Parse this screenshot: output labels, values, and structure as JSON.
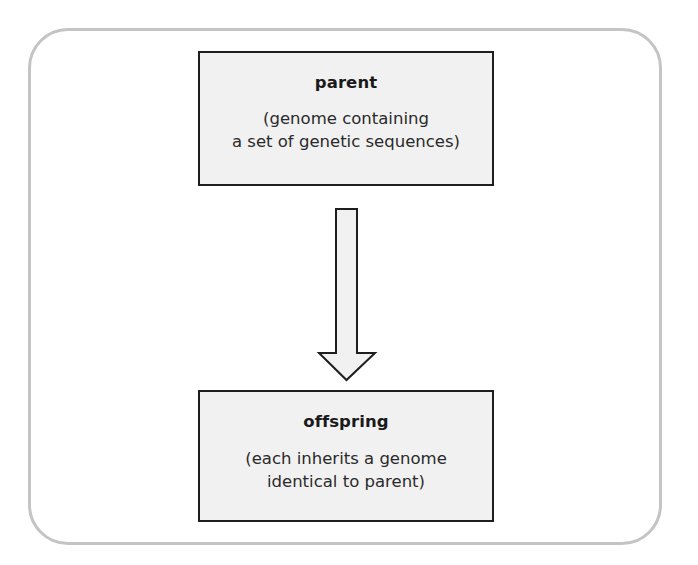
{
  "diagram": {
    "parent": {
      "title": "parent",
      "desc_line1": "(genome containing",
      "desc_line2": "a set of genetic sequences)"
    },
    "arrow": {
      "direction": "down",
      "icon": "down-arrow-icon"
    },
    "offspring": {
      "title": "offspring",
      "desc_line1": "(each inherits a genome",
      "desc_line2": "identical to parent)"
    }
  },
  "colors": {
    "frame_border": "#c4c4c4",
    "box_border": "#1e1e1e",
    "box_fill": "#f1f1f1",
    "arrow_fill": "#f1f1f1"
  }
}
